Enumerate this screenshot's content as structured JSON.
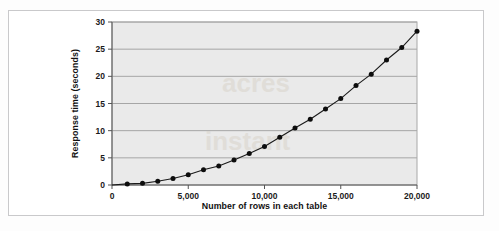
{
  "figure": {
    "frame_border_color": "#c9c9cb",
    "page_background": "#fdfdfd"
  },
  "chart_data": {
    "type": "line",
    "title": "",
    "subtitle": "",
    "xlabel": "Number of rows in each table",
    "ylabel": "Response time (seconds)",
    "xlim": [
      0,
      20000
    ],
    "ylim": [
      0,
      30
    ],
    "grid": "horizontal",
    "legend": "none",
    "plot_background": "#eaeaea",
    "gridline_color": "#9e9e9e",
    "series_color": "#1a1a1a",
    "marker": "filled-circle",
    "xticks": [
      0,
      5000,
      10000,
      15000,
      20000
    ],
    "xtick_labels": [
      "0",
      "5,000",
      "10,000",
      "15,000",
      "20,000"
    ],
    "yticks": [
      0,
      5,
      10,
      15,
      20,
      25,
      30
    ],
    "ytick_labels": [
      "0",
      "5",
      "10",
      "15",
      "20",
      "25",
      "30"
    ],
    "x": [
      1000,
      2000,
      3000,
      4000,
      5000,
      6000,
      7000,
      8000,
      9000,
      10000,
      11000,
      12000,
      13000,
      14000,
      15000,
      16000,
      17000,
      18000,
      19000,
      20000
    ],
    "series": [
      {
        "name": "Response time",
        "values": [
          0.2,
          0.3,
          0.7,
          1.2,
          1.9,
          2.8,
          3.5,
          4.6,
          5.8,
          7.1,
          8.8,
          10.5,
          12.1,
          14.0,
          15.9,
          18.3,
          20.4,
          23.0,
          25.3,
          28.3
        ]
      }
    ]
  }
}
